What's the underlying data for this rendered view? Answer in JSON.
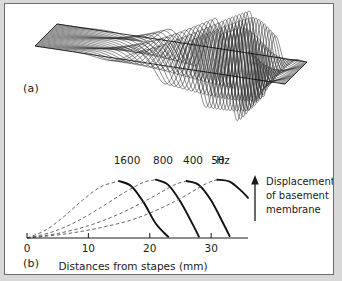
{
  "figure": {
    "background_color": "#ffffff",
    "border_color": "#6e6e6e",
    "ink_color": "#1a1a1a"
  },
  "panel_a": {
    "tag": "(a)",
    "description": "three-dimensional waterfall mesh of basilar-membrane traveling wave",
    "mesh_line_count": 28,
    "mesh_color": "#2b2b2b",
    "outline_color": "#000000"
  },
  "panel_b": {
    "tag": "(b)",
    "annotation": {
      "arrow": "up-arrow",
      "line1": "Displacement",
      "line2": "of basement",
      "line3": "membrane"
    }
  },
  "chart_data": {
    "type": "line",
    "title": "",
    "xlabel": "Distances from stapes (mm)",
    "ylabel": "Displacement of basement membrane",
    "xlim": [
      0,
      36
    ],
    "ylim": [
      0,
      1.05
    ],
    "grid": false,
    "legend": "inline-top",
    "unit_label": "Hz",
    "xticks": [
      0,
      10,
      20,
      30
    ],
    "xtick_labels": [
      "0",
      "10",
      "20",
      "30"
    ],
    "yticks": [],
    "series": [
      {
        "name": "1600",
        "label": "1600",
        "peak_position_mm": 15,
        "peak_value": 0.88,
        "rising_flank_style": "dashed",
        "falling_flank_style": "solid",
        "x": [
          0,
          3,
          6,
          9,
          12,
          15,
          17,
          19,
          21,
          23
        ],
        "values": [
          0.0,
          0.12,
          0.33,
          0.58,
          0.79,
          0.88,
          0.8,
          0.55,
          0.22,
          0.02
        ]
      },
      {
        "name": "800",
        "label": "800",
        "peak_position_mm": 21,
        "peak_value": 0.9,
        "rising_flank_style": "dashed",
        "falling_flank_style": "solid",
        "x": [
          0,
          4,
          8,
          12,
          16,
          19,
          21,
          23,
          25,
          27,
          28
        ],
        "values": [
          0.0,
          0.09,
          0.25,
          0.47,
          0.71,
          0.86,
          0.9,
          0.82,
          0.56,
          0.21,
          0.02
        ]
      },
      {
        "name": "400",
        "label": "400",
        "peak_position_mm": 26,
        "peak_value": 0.88,
        "rising_flank_style": "dashed",
        "falling_flank_style": "solid",
        "x": [
          0,
          5,
          10,
          15,
          20,
          24,
          26,
          28,
          30,
          32,
          33
        ],
        "values": [
          0.0,
          0.07,
          0.19,
          0.37,
          0.61,
          0.82,
          0.88,
          0.82,
          0.58,
          0.22,
          0.03
        ]
      },
      {
        "name": "50",
        "label": "50",
        "peak_position_mm": 31,
        "peak_value": 0.9,
        "rising_flank_style": "dashed",
        "falling_flank_style": "solid",
        "x": [
          0,
          6,
          12,
          18,
          24,
          29,
          31,
          33,
          35,
          36
        ],
        "values": [
          0.0,
          0.06,
          0.16,
          0.31,
          0.56,
          0.83,
          0.9,
          0.87,
          0.72,
          0.62
        ]
      }
    ]
  }
}
